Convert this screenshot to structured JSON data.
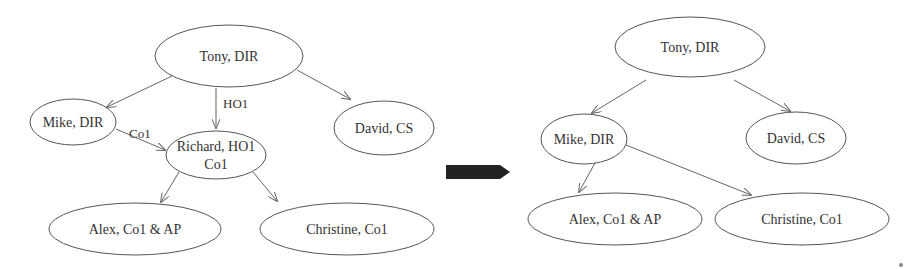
{
  "before": {
    "nodes": [
      {
        "id": "tony",
        "label": "Tony, DIR",
        "cx": 229,
        "cy": 56,
        "rx": 74,
        "ry": 31
      },
      {
        "id": "mike",
        "label": "Mike, DIR",
        "cx": 73,
        "cy": 122,
        "rx": 43,
        "ry": 23
      },
      {
        "id": "david",
        "label": "David, CS",
        "cx": 384,
        "cy": 128,
        "rx": 50,
        "ry": 27
      },
      {
        "id": "richard",
        "label": "Richard, HO1",
        "label2": "Co1",
        "cx": 216,
        "cy": 155,
        "rx": 50,
        "ry": 24
      },
      {
        "id": "alex",
        "label": "Alex, Co1 & AP",
        "cx": 135,
        "cy": 229,
        "rx": 86,
        "ry": 26
      },
      {
        "id": "christine",
        "label": "Christine, Co1",
        "cx": 347,
        "cy": 229,
        "rx": 87,
        "ry": 26
      }
    ],
    "edges": [
      {
        "from": "tony",
        "to": "mike",
        "label": ""
      },
      {
        "from": "tony",
        "to": "richard",
        "label": "HO1"
      },
      {
        "from": "tony",
        "to": "david",
        "label": ""
      },
      {
        "from": "mike",
        "to": "richard",
        "label": "Co1"
      },
      {
        "from": "richard",
        "to": "alex",
        "label": ""
      },
      {
        "from": "richard",
        "to": "christine",
        "label": ""
      }
    ]
  },
  "transition_arrow": {
    "label": "",
    "color": "#222222"
  },
  "after": {
    "nodes": [
      {
        "id": "tony",
        "label": "Tony, DIR",
        "cx": 690,
        "cy": 47,
        "rx": 75,
        "ry": 30
      },
      {
        "id": "mike",
        "label": "Mike, DIR",
        "cx": 584,
        "cy": 139,
        "rx": 43,
        "ry": 25
      },
      {
        "id": "david",
        "label": "David, CS",
        "cx": 796,
        "cy": 138,
        "rx": 50,
        "ry": 26
      },
      {
        "id": "alex",
        "label": "Alex, Co1 & AP",
        "cx": 615,
        "cy": 219,
        "rx": 87,
        "ry": 26
      },
      {
        "id": "christine",
        "label": "Christine, Co1",
        "cx": 802,
        "cy": 219,
        "rx": 87,
        "ry": 26
      }
    ],
    "edges": [
      {
        "from": "tony",
        "to": "mike",
        "label": ""
      },
      {
        "from": "tony",
        "to": "david",
        "label": ""
      },
      {
        "from": "mike",
        "to": "alex",
        "label": ""
      },
      {
        "from": "mike",
        "to": "christine",
        "label": ""
      }
    ]
  }
}
